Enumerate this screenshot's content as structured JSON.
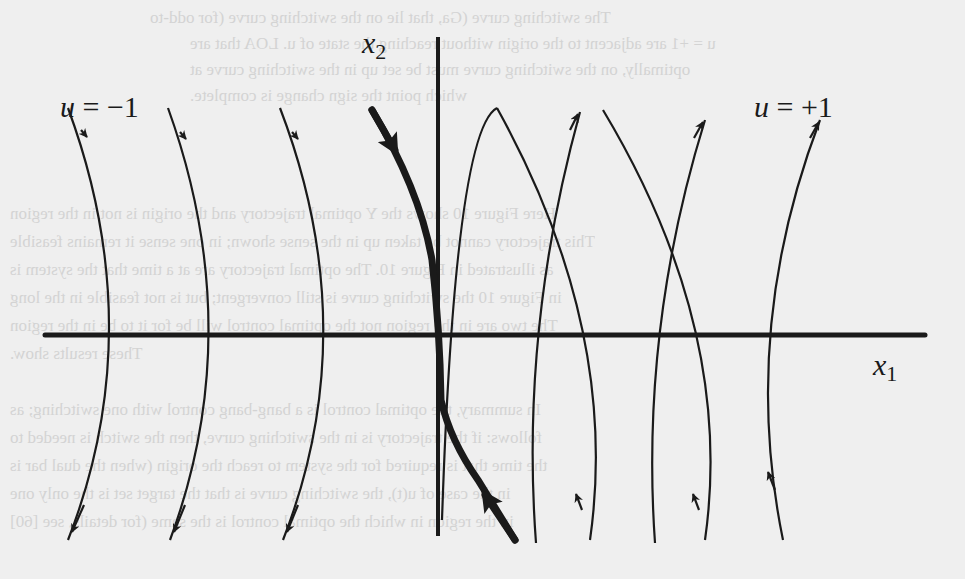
{
  "diagram": {
    "type": "phase-portrait",
    "axes": {
      "x_axis_label": "x",
      "x_axis_sub": "1",
      "y_axis_label": "x",
      "y_axis_sub": "2"
    },
    "families": [
      {
        "label_var": "u",
        "label_eq": " = −1",
        "direction": "downward",
        "curve_count": 3
      },
      {
        "label_var": "u",
        "label_eq": " = +1",
        "direction": "upward",
        "curve_count": 3
      }
    ],
    "switching_curve": {
      "style": "thick",
      "arrows": "toward origin"
    }
  },
  "colors": {
    "ink": "#1a1a1a",
    "paper": "#efefef",
    "bleed": "#bdbdbd"
  },
  "bleed_text": [
    "The switching curve (Ga, that lie on the switching curve (for odd-to",
    "u = +1 are adjacent to the origin without reaching the state of u. LOA that are",
    "optimally, on the switching curve must be set up in the switching curve at",
    "which point the sign change is complete.",
    "Here Figure 10 shows the Y optimal trajectory and the origin is not in the region",
    "This trajectory cannot be taken up in the sense shown; in one sense it remains feasible",
    "as illustrated in Figure 10. The optimal trajectory are at a time that the system is",
    "in Figure 10 the switching curve is still convergent; but is not feasible in the long",
    "The two are in the region not the optimal control will be for it to be in the region",
    "These results show.",
    "In summary, the optimal control is a bang-bang control with one switching; as",
    "follows: if the trajectory is in the switching curve, then the switch is needed to",
    "the time that is required for the system to reach the origin (when the dual bar is",
    "in the case of u(t), the switching curve is that the target set is the only one",
    "in the region in which the optimal control is the same (for details, see [60]"
  ]
}
